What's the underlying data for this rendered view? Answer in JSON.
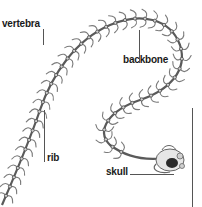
{
  "diagram": {
    "labels": {
      "vertebra": "vertebra",
      "backbone": "backbone",
      "rib": "rib",
      "skull": "skull"
    },
    "colors": {
      "bone_stroke": "#6f6f6f",
      "bone_fill": "#e2e2e2",
      "skull_dark": "#2a2a2a",
      "leader_line": "#555555",
      "label_text": "#1a1a1a",
      "background": "#ffffff"
    }
  }
}
